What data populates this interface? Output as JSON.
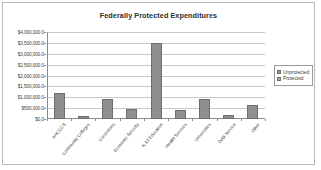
{
  "chart_data": {
    "type": "bar",
    "title": "Federally Protected Expenditures",
    "xlabel": "",
    "ylabel": "",
    "ylim": [
      0,
      4000000
    ],
    "grid": true,
    "legend_position": "right",
    "categories": [
      "AHCCCS",
      "Community Colleges",
      "Corrections",
      "Economic Security",
      "K-12 Education",
      "Health Services",
      "Universities",
      "Debt Service",
      "Other"
    ],
    "values": [
      1200000,
      150000,
      900000,
      450000,
      3500000,
      420000,
      920000,
      200000,
      650000
    ],
    "series": [
      {
        "name": "Unprotected",
        "values": [
          1200000,
          150000,
          900000,
          450000,
          3500000,
          420000,
          920000,
          200000,
          650000
        ]
      }
    ],
    "legend": [
      "Unprotected",
      "Protected"
    ],
    "ytick_labels": [
      "$4,000,000.0",
      "$3,500,000.0",
      "$3,000,000.0",
      "$2,500,000.0",
      "$2,000,000.0",
      "$1,500,000.0",
      "$1,000,000.0",
      "$500,000.0",
      "$0.0"
    ],
    "ytick_values": [
      4000000,
      3500000,
      3000000,
      2500000,
      2000000,
      1500000,
      1000000,
      500000,
      0
    ],
    "colors": {
      "unprotected_swatch": "#8f8f8f",
      "protected_swatch": "#a8a8a8",
      "bar_fill": "#8f8f8f",
      "bar_border": "#6f6f6f",
      "gridline": "#c8c8c8",
      "axis": "#8a8a8a",
      "frame": "#b9b9b9",
      "title_text": "#2b2b2b",
      "label_text": "#3a3a3a"
    }
  }
}
